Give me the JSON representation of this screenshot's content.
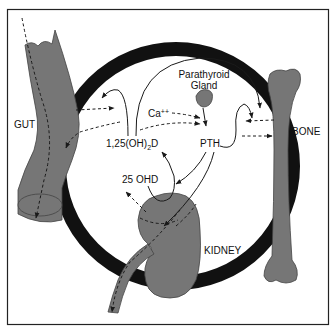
{
  "diagram": {
    "ring_label": "EXTRACELLULAR FLUID",
    "labels": {
      "gut": "GUT",
      "bone": "BONE",
      "kidney": "KIDNEY",
      "parathyroid_line1": "Parathyroid",
      "parathyroid_line2": "Gland",
      "calcium": "Ca",
      "calcium_charge": "++",
      "vitd_prefix": "1,25(OH)",
      "vitd_sub": "2",
      "vitd_suffix": "D",
      "pth": "PTH",
      "ohd": "25 OHD"
    },
    "colors": {
      "organ_fill": "#767676",
      "ring": "#111111",
      "frame": "#222222",
      "background": "#ffffff"
    }
  }
}
